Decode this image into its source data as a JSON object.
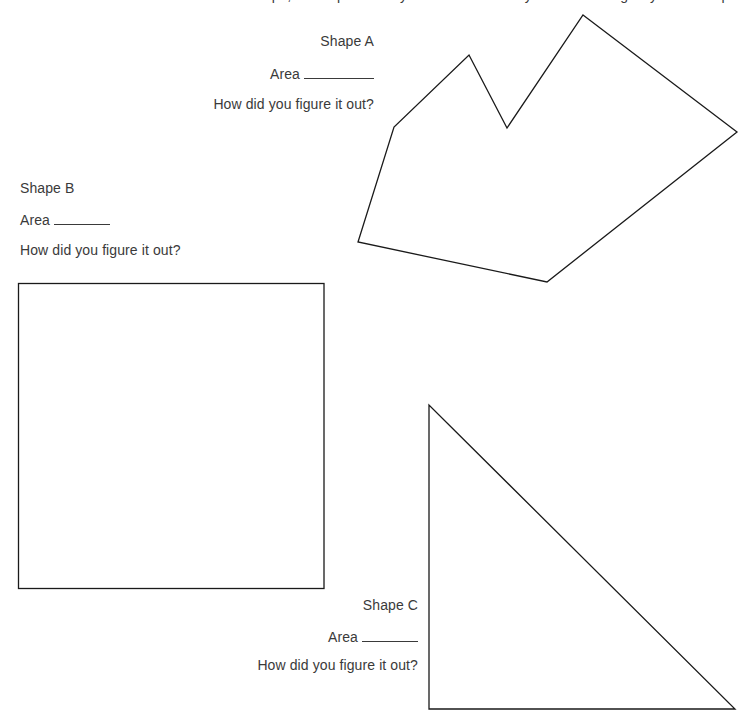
{
  "header": {
    "clipped_instructions": "Find the area of each shape, and explain how you found it. Use any tools or strategies you find helpful."
  },
  "shapes": {
    "a": {
      "label": "Shape A",
      "area_label": "Area",
      "question": "How did you figure it out?"
    },
    "b": {
      "label": "Shape B",
      "area_label": "Area",
      "question": "How did you figure it out?"
    },
    "c": {
      "label": "Shape C",
      "area_label": "Area",
      "question": "How did you figure it out?"
    }
  },
  "colors": {
    "text": "#3a3a3a",
    "stroke": "#1a1a1a",
    "background": "#ffffff"
  }
}
